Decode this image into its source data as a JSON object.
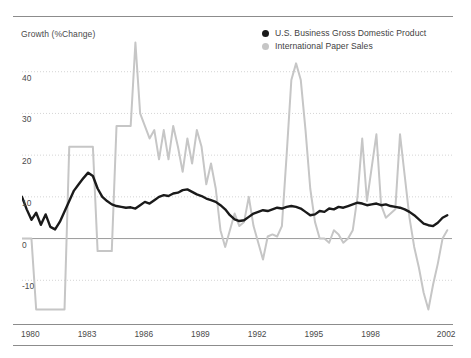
{
  "chart_data": {
    "type": "line",
    "title": "",
    "ylabel": "Growth (%Change)",
    "xlabel": "",
    "ylim": [
      -20,
      50
    ],
    "xlim": [
      1980,
      2002.75
    ],
    "grid": true,
    "grid_style": "dotted-horizontal",
    "zero_line": true,
    "legend_position": "top-right",
    "yticks": [
      40,
      30,
      20,
      10,
      0,
      -10
    ],
    "ytick_labels": [
      "40",
      "30",
      "20",
      "10",
      "0",
      "-10"
    ],
    "xticks": [
      1980,
      1983,
      1986,
      1989,
      1992,
      1995,
      1998,
      2002
    ],
    "xtick_labels": [
      "1980",
      "1983",
      "1986",
      "1989",
      "1992",
      "1995",
      "1998",
      "2002"
    ],
    "series": [
      {
        "name": "U.S. Business Gross Domestic Product",
        "color": "#1a1a1a",
        "marker": "circle",
        "x": [
          1980.0,
          1980.25,
          1980.5,
          1980.75,
          1981.0,
          1981.25,
          1981.5,
          1981.75,
          1982.0,
          1982.25,
          1982.5,
          1982.75,
          1983.0,
          1983.25,
          1983.5,
          1983.75,
          1984.0,
          1984.25,
          1984.5,
          1984.75,
          1985.0,
          1985.25,
          1985.5,
          1985.75,
          1986.0,
          1986.25,
          1986.5,
          1986.75,
          1987.0,
          1987.25,
          1987.5,
          1987.75,
          1988.0,
          1988.25,
          1988.5,
          1988.75,
          1989.0,
          1989.25,
          1989.5,
          1989.75,
          1990.0,
          1990.25,
          1990.5,
          1990.75,
          1991.0,
          1991.25,
          1991.5,
          1991.75,
          1992.0,
          1992.25,
          1992.5,
          1992.75,
          1993.0,
          1993.25,
          1993.5,
          1993.75,
          1994.0,
          1994.25,
          1994.5,
          1994.75,
          1995.0,
          1995.25,
          1995.5,
          1995.75,
          1996.0,
          1996.25,
          1996.5,
          1996.75,
          1997.0,
          1997.25,
          1997.5,
          1997.75,
          1998.0,
          1998.25,
          1998.5,
          1998.75,
          1999.0,
          1999.25,
          1999.5,
          1999.75,
          2000.0,
          2000.25,
          2000.5,
          2000.75,
          2001.0,
          2001.25,
          2001.5,
          2001.75,
          2002.0,
          2002.25,
          2002.5
        ],
        "values": [
          10.0,
          7.0,
          4.5,
          6.2,
          3.3,
          5.8,
          2.8,
          2.2,
          4.0,
          6.5,
          9.0,
          11.5,
          13.0,
          14.5,
          15.8,
          15.0,
          12.0,
          10.0,
          9.0,
          8.2,
          7.8,
          7.6,
          7.4,
          7.5,
          7.2,
          8.0,
          8.8,
          8.4,
          9.2,
          10.0,
          10.4,
          10.2,
          10.8,
          11.0,
          11.6,
          11.8,
          11.2,
          10.6,
          10.2,
          9.6,
          9.2,
          8.8,
          8.0,
          7.0,
          5.6,
          4.6,
          4.2,
          4.4,
          5.2,
          6.0,
          6.4,
          6.8,
          6.6,
          7.0,
          7.4,
          7.2,
          7.6,
          7.8,
          7.6,
          7.2,
          6.4,
          5.6,
          5.8,
          6.6,
          6.4,
          7.2,
          7.0,
          7.6,
          7.4,
          7.8,
          8.2,
          8.6,
          8.4,
          8.0,
          8.2,
          8.4,
          8.0,
          8.2,
          7.8,
          7.6,
          7.4,
          7.0,
          6.4,
          5.6,
          4.6,
          3.6,
          3.2,
          3.0,
          3.8,
          5.0,
          5.6
        ]
      },
      {
        "name": "International Paper Sales",
        "color": "#c6c6c6",
        "marker": "circle",
        "x": [
          1980.0,
          1980.25,
          1980.5,
          1980.75,
          1981.0,
          1981.25,
          1981.5,
          1981.75,
          1982.0,
          1982.25,
          1982.5,
          1982.75,
          1983.0,
          1983.25,
          1983.5,
          1983.75,
          1984.0,
          1984.25,
          1984.5,
          1984.75,
          1985.0,
          1985.25,
          1985.5,
          1985.75,
          1986.0,
          1986.25,
          1986.5,
          1986.75,
          1987.0,
          1987.25,
          1987.5,
          1987.75,
          1988.0,
          1988.25,
          1988.5,
          1988.75,
          1989.0,
          1989.25,
          1989.5,
          1989.75,
          1990.0,
          1990.25,
          1990.5,
          1990.75,
          1991.0,
          1991.25,
          1991.5,
          1991.75,
          1992.0,
          1992.25,
          1992.5,
          1992.75,
          1993.0,
          1993.25,
          1993.5,
          1993.75,
          1994.0,
          1994.25,
          1994.5,
          1994.75,
          1995.0,
          1995.25,
          1995.5,
          1995.75,
          1996.0,
          1996.25,
          1996.5,
          1996.75,
          1997.0,
          1997.25,
          1997.5,
          1997.75,
          1998.0,
          1998.25,
          1998.5,
          1998.75,
          1999.0,
          1999.25,
          1999.5,
          1999.75,
          2000.0,
          2000.25,
          2000.5,
          2000.75,
          2001.0,
          2001.25,
          2001.5,
          2001.75,
          2002.0,
          2002.25,
          2002.5
        ],
        "values": [
          0.0,
          0.0,
          0.0,
          -17.0,
          -17.0,
          -17.0,
          -17.0,
          -17.0,
          -17.0,
          -17.0,
          22.0,
          22.0,
          22.0,
          22.0,
          22.0,
          22.0,
          -3.0,
          -3.0,
          -3.0,
          -3.0,
          27.0,
          27.0,
          27.0,
          27.0,
          47.0,
          30.0,
          27.0,
          24.0,
          26.0,
          19.0,
          26.0,
          19.0,
          27.0,
          22.0,
          16.0,
          24.0,
          18.0,
          26.0,
          22.0,
          13.0,
          18.0,
          12.0,
          2.0,
          -2.0,
          2.0,
          6.0,
          3.0,
          4.0,
          10.0,
          3.0,
          -1.0,
          -5.0,
          0.5,
          1.0,
          0.5,
          3.0,
          20.0,
          38.0,
          42.0,
          38.0,
          26.0,
          12.0,
          4.0,
          0.0,
          0.0,
          -1.0,
          2.0,
          1.0,
          -1.0,
          0.0,
          2.0,
          10.0,
          24.0,
          9.0,
          17.0,
          25.0,
          8.0,
          5.0,
          6.0,
          7.0,
          25.0,
          15.0,
          5.0,
          -2.0,
          -7.0,
          -13.0,
          -17.0,
          -11.0,
          -6.0,
          0.0,
          2.0
        ]
      }
    ]
  }
}
